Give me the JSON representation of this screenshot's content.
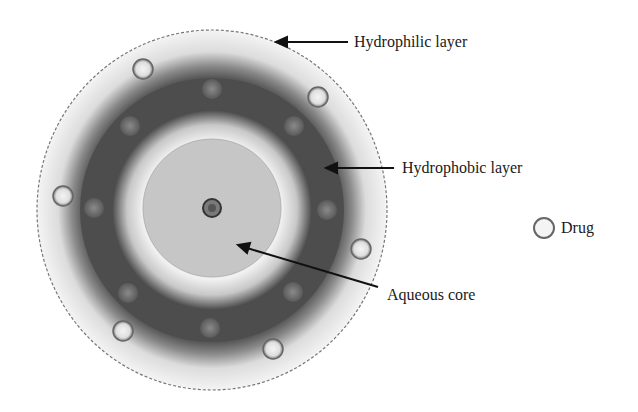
{
  "labels": {
    "hydrophilic": "Hydrophilic layer",
    "hydrophobic": "Hydrophobic layer",
    "aqueous": "Aqueous core",
    "drug": "Drug"
  },
  "colors": {
    "outer_ring": "#ececec",
    "hydrophobic_ring": "#4a4a4a",
    "inner_ring": "#d9d9d9",
    "core": "#c2c2c2",
    "drug_fill": "#e8e8e8",
    "drug_stroke": "#666666"
  }
}
